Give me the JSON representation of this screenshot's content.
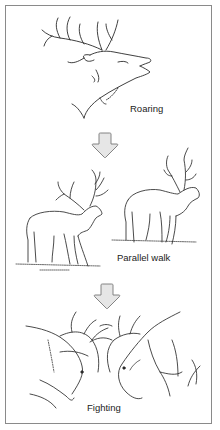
{
  "diagram": {
    "type": "behavior-sequence",
    "stages": [
      {
        "label": "Roaring",
        "illustration": "stag-head-roaring"
      },
      {
        "label": "Parallel walk",
        "illustration": "two-stags-walking"
      },
      {
        "label": "Fighting",
        "illustration": "two-stags-antlers-locked"
      }
    ],
    "connectors": [
      {
        "from": "Roaring",
        "to": "Parallel walk",
        "icon": "down-arrow-icon"
      },
      {
        "from": "Parallel walk",
        "to": "Fighting",
        "icon": "down-arrow-icon"
      }
    ],
    "colors": {
      "border": "#8a8a8a",
      "arrow_fill": "#e6e6e6",
      "arrow_stroke": "#777777",
      "line_art": "#2a2a2a",
      "text": "#222222"
    }
  }
}
